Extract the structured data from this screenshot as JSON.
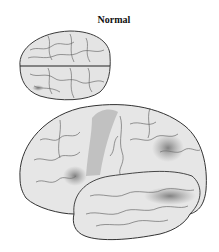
{
  "figure": {
    "title": "Normal",
    "views": [
      {
        "name": "superior-view",
        "label": ""
      },
      {
        "name": "lateral-view",
        "label": ""
      }
    ],
    "colors": {
      "brain_fill": "#e6e6e6",
      "outline": "#3a3a3a",
      "sulci": "#555555",
      "shade_light": "#a9a9a9",
      "shade_dark": "#7a7a7a",
      "background": "#ffffff"
    }
  }
}
